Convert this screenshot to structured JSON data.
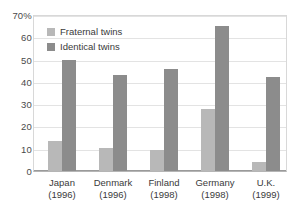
{
  "chart_data": {
    "type": "bar",
    "title": "",
    "subtitle": "",
    "xlabel": "",
    "ylabel": "",
    "ylim": [
      0,
      70
    ],
    "yticks": [
      0,
      10,
      20,
      30,
      40,
      50,
      60,
      70
    ],
    "ytick_labels": [
      "0",
      "10",
      "20",
      "30",
      "40",
      "50",
      "60",
      "70%"
    ],
    "grid": true,
    "legend_position": "top-left",
    "categories": [
      "Japan",
      "Denmark",
      "Finland",
      "Germany",
      "U.K."
    ],
    "category_years": [
      "(1996)",
      "(1996)",
      "(1998)",
      "(1998)",
      "(1999)"
    ],
    "category_labels": [
      "Japan\n(1996)",
      "Denmark\n(1996)",
      "Finland\n(1998)",
      "Germany\n(1998)",
      "U.K.\n(1999)"
    ],
    "series": [
      {
        "name": "Fraternal twins",
        "color": "#b8b8b8",
        "values": [
          13.5,
          10.2,
          9.5,
          28,
          4
        ]
      },
      {
        "name": "Identical twins",
        "color": "#8c8c8c",
        "values": [
          50,
          43,
          46,
          65,
          42
        ]
      }
    ]
  },
  "legend": {
    "items": [
      {
        "label": "Fraternal twins",
        "swatch": "fraternal"
      },
      {
        "label": "Identical twins",
        "swatch": "identical"
      }
    ]
  },
  "colors": {
    "fraternal": "#b8b8b8",
    "identical": "#8c8c8c",
    "grid": "#e3e3e3",
    "frame": "#d8d8d8",
    "axis": "#9a9a9a",
    "text": "#3a3a3a",
    "background": "#ffffff"
  }
}
